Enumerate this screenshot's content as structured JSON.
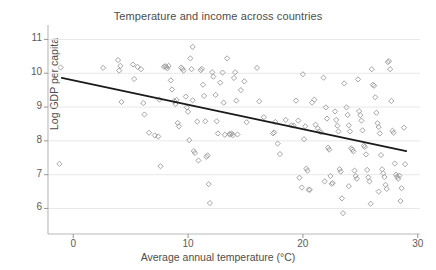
{
  "chart_data": {
    "type": "scatter",
    "title": "Temperature and income across countries",
    "xlabel": "Average annual temperature (°C)",
    "ylabel": "Log GDP per capita",
    "xlim": [
      -2.2,
      30.2
    ],
    "ylim": [
      5.6,
      11.25
    ],
    "xticks": [
      0,
      10,
      20,
      30
    ],
    "yticks": [
      6,
      7,
      8,
      9,
      10,
      11
    ],
    "xtick_labels": [
      "0",
      "10",
      "20",
      "30"
    ],
    "ytick_labels": [
      "6",
      "7",
      "8",
      "9",
      "10",
      "11"
    ],
    "grid": "horizontal",
    "legend": "none",
    "marker": "diamond-open",
    "marker_color": "#9a9a9a",
    "line_color": "#1a1a1a",
    "background": "#ffffff",
    "fit_line": {
      "label": "linear fit",
      "x": [
        -1.0,
        29.0
      ],
      "y": [
        9.86,
        7.7
      ],
      "slope": -0.072,
      "intercept": 9.79
    },
    "points": [
      [
        -1.1,
        10.17
      ],
      [
        -1.2,
        7.32
      ],
      [
        2.6,
        10.16
      ],
      [
        3.9,
        10.39
      ],
      [
        4.0,
        10.08
      ],
      [
        4.1,
        10.22
      ],
      [
        4.2,
        9.15
      ],
      [
        5.2,
        10.26
      ],
      [
        5.6,
        10.19
      ],
      [
        5.3,
        9.83
      ],
      [
        5.9,
        10.12
      ],
      [
        6.1,
        9.12
      ],
      [
        6.2,
        8.78
      ],
      [
        6.6,
        8.24
      ],
      [
        7.1,
        8.16
      ],
      [
        7.4,
        8.13
      ],
      [
        7.5,
        9.22
      ],
      [
        7.6,
        7.25
      ],
      [
        7.9,
        10.19
      ],
      [
        8.0,
        10.21
      ],
      [
        8.1,
        10.18
      ],
      [
        8.2,
        10.15
      ],
      [
        8.3,
        10.22
      ],
      [
        8.5,
        9.79
      ],
      [
        8.6,
        9.52
      ],
      [
        8.8,
        9.18
      ],
      [
        8.9,
        9.09
      ],
      [
        9.0,
        9.21
      ],
      [
        9.1,
        8.53
      ],
      [
        9.2,
        8.43
      ],
      [
        9.4,
        10.17
      ],
      [
        9.5,
        10.13
      ],
      [
        9.6,
        10.08
      ],
      [
        9.8,
        9.31
      ],
      [
        9.9,
        8.99
      ],
      [
        10.0,
        8.86
      ],
      [
        10.1,
        8.02
      ],
      [
        10.2,
        10.44
      ],
      [
        10.3,
        10.12
      ],
      [
        10.4,
        9.2
      ],
      [
        10.5,
        7.7
      ],
      [
        10.6,
        7.64
      ],
      [
        10.8,
        8.57
      ],
      [
        10.9,
        7.42
      ],
      [
        11.1,
        10.09
      ],
      [
        11.2,
        10.13
      ],
      [
        11.3,
        9.66
      ],
      [
        11.4,
        9.33
      ],
      [
        11.5,
        8.58
      ],
      [
        11.6,
        7.53
      ],
      [
        11.7,
        7.57
      ],
      [
        11.8,
        6.72
      ],
      [
        11.9,
        6.16
      ],
      [
        10.4,
        10.78
      ],
      [
        12.1,
        10.03
      ],
      [
        12.2,
        9.9
      ],
      [
        12.4,
        9.36
      ],
      [
        12.5,
        8.58
      ],
      [
        12.6,
        8.22
      ],
      [
        12.8,
        9.72
      ],
      [
        13.0,
        10.02
      ],
      [
        13.1,
        9.13
      ],
      [
        13.2,
        8.18
      ],
      [
        13.4,
        10.44
      ],
      [
        13.6,
        8.2
      ],
      [
        13.7,
        8.19
      ],
      [
        13.8,
        8.22
      ],
      [
        13.9,
        8.17
      ],
      [
        14.0,
        9.86
      ],
      [
        14.1,
        10.03
      ],
      [
        14.2,
        9.19
      ],
      [
        14.3,
        8.19
      ],
      [
        14.6,
        9.5
      ],
      [
        14.9,
        9.76
      ],
      [
        15.1,
        8.55
      ],
      [
        16.0,
        10.16
      ],
      [
        16.2,
        9.17
      ],
      [
        16.6,
        8.7
      ],
      [
        17.4,
        8.22
      ],
      [
        17.5,
        8.25
      ],
      [
        17.6,
        8.56
      ],
      [
        17.8,
        7.92
      ],
      [
        18.0,
        7.61
      ],
      [
        18.5,
        8.62
      ],
      [
        19.0,
        8.46
      ],
      [
        19.2,
        8.45
      ],
      [
        19.4,
        9.19
      ],
      [
        19.6,
        8.6
      ],
      [
        19.7,
        6.91
      ],
      [
        19.9,
        6.62
      ],
      [
        20.0,
        9.97
      ],
      [
        20.1,
        8.05
      ],
      [
        20.2,
        8.43
      ],
      [
        20.3,
        7.18
      ],
      [
        20.4,
        7.12
      ],
      [
        20.5,
        6.56
      ],
      [
        20.6,
        6.55
      ],
      [
        20.8,
        9.13
      ],
      [
        21.0,
        9.22
      ],
      [
        21.1,
        8.48
      ],
      [
        21.3,
        8.37
      ],
      [
        21.4,
        8.28
      ],
      [
        21.6,
        8.25
      ],
      [
        21.8,
        9.87
      ],
      [
        22.0,
        8.99
      ],
      [
        22.1,
        8.66
      ],
      [
        22.2,
        7.8
      ],
      [
        22.3,
        7.74
      ],
      [
        22.4,
        6.96
      ],
      [
        22.5,
        6.73
      ],
      [
        22.6,
        6.75
      ],
      [
        22.8,
        8.87
      ],
      [
        22.9,
        8.62
      ],
      [
        23.0,
        8.45
      ],
      [
        23.1,
        8.28
      ],
      [
        23.2,
        7.16
      ],
      [
        23.3,
        7.09
      ],
      [
        23.4,
        6.3
      ],
      [
        23.5,
        5.86
      ],
      [
        23.6,
        9.7
      ],
      [
        23.8,
        8.99
      ],
      [
        23.9,
        8.77
      ],
      [
        24.0,
        8.46
      ],
      [
        24.1,
        8.28
      ],
      [
        24.2,
        7.78
      ],
      [
        24.3,
        7.74
      ],
      [
        24.4,
        7.69
      ],
      [
        24.5,
        7.12
      ],
      [
        24.6,
        6.96
      ],
      [
        24.7,
        6.88
      ],
      [
        24.8,
        9.82
      ],
      [
        24.9,
        8.88
      ],
      [
        25.0,
        8.76
      ],
      [
        25.1,
        8.6
      ],
      [
        25.2,
        8.31
      ],
      [
        25.3,
        7.86
      ],
      [
        25.4,
        7.82
      ],
      [
        25.5,
        7.6
      ],
      [
        25.6,
        7.14
      ],
      [
        25.7,
        6.92
      ],
      [
        25.8,
        6.8
      ],
      [
        25.9,
        6.14
      ],
      [
        26.0,
        10.12
      ],
      [
        26.1,
        9.66
      ],
      [
        26.2,
        9.63
      ],
      [
        26.3,
        9.29
      ],
      [
        26.4,
        8.83
      ],
      [
        26.5,
        8.52
      ],
      [
        26.6,
        8.41
      ],
      [
        26.7,
        8.22
      ],
      [
        26.8,
        7.58
      ],
      [
        26.9,
        7.16
      ],
      [
        27.0,
        7.04
      ],
      [
        27.1,
        6.93
      ],
      [
        27.2,
        6.7
      ],
      [
        27.3,
        6.58
      ],
      [
        27.4,
        10.33
      ],
      [
        27.5,
        10.36
      ],
      [
        27.6,
        10.12
      ],
      [
        27.7,
        9.18
      ],
      [
        27.8,
        8.3
      ],
      [
        27.9,
        8.24
      ],
      [
        28.0,
        7.33
      ],
      [
        28.1,
        7.0
      ],
      [
        28.2,
        6.94
      ],
      [
        28.3,
        6.88
      ],
      [
        28.4,
        6.97
      ],
      [
        28.5,
        6.22
      ],
      [
        28.8,
        8.39
      ],
      [
        28.9,
        7.31
      ],
      [
        28.6,
        6.6
      ],
      [
        24.0,
        6.66
      ],
      [
        21.9,
        6.8
      ],
      [
        26.6,
        6.5
      ]
    ]
  }
}
